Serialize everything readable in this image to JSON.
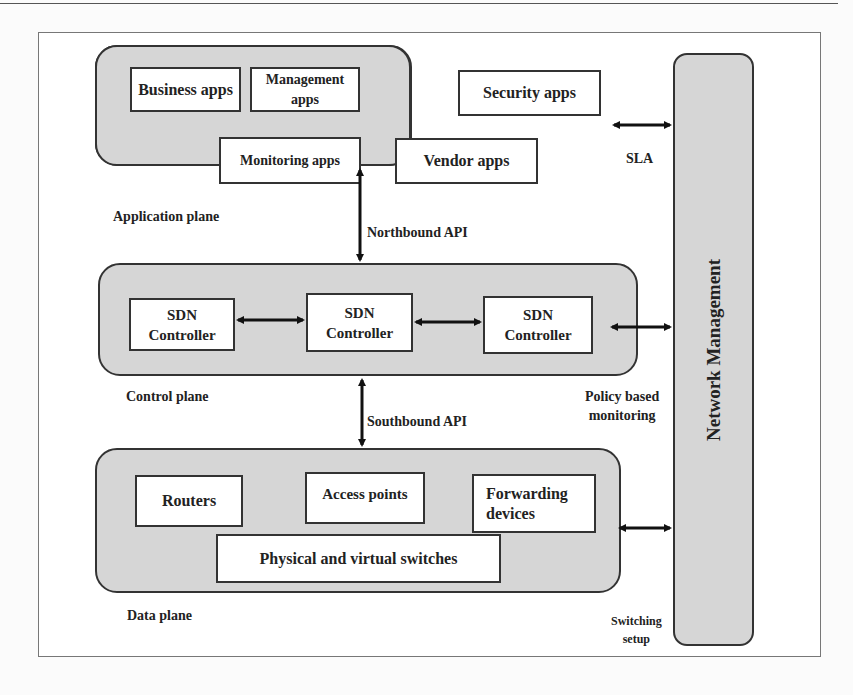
{
  "diagram": {
    "application_plane": {
      "label": "Application plane",
      "apps": [
        {
          "label": "Business apps"
        },
        {
          "label": "Management apps"
        },
        {
          "label": "Security apps"
        },
        {
          "label": "Monitoring apps"
        },
        {
          "label": "Vendor apps"
        }
      ]
    },
    "control_plane": {
      "label": "Control plane",
      "controllers": [
        {
          "line1": "SDN",
          "line2": "Controller"
        },
        {
          "line1": "SDN",
          "line2": "Controller"
        },
        {
          "line1": "SDN",
          "line2": "Controller"
        }
      ]
    },
    "data_plane": {
      "label": "Data plane",
      "devices": [
        {
          "label": "Routers"
        },
        {
          "label": "Access points"
        },
        {
          "line1": "Forwarding",
          "line2": "devices"
        },
        {
          "label": "Physical and virtual switches"
        }
      ]
    },
    "network_management": {
      "label": "Network Management"
    },
    "connections": {
      "northbound": "Northbound API",
      "southbound": "Southbound API",
      "sla": "SLA",
      "policy_line1": "Policy based",
      "policy_line2": "monitoring",
      "switching_line1": "Switching",
      "switching_line2": "setup"
    },
    "colors": {
      "plane_fill": "#d6d6d6",
      "box_fill": "#ffffff",
      "stroke": "#333333"
    }
  }
}
